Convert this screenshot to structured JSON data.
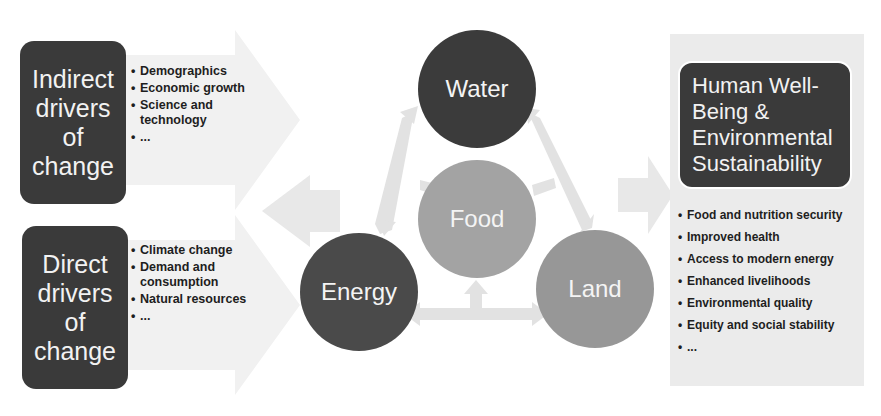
{
  "diagram": {
    "left": {
      "indirect": {
        "title_lines": [
          "Indirect",
          "drivers",
          "of",
          "change"
        ],
        "bullets": [
          "Demographics",
          "Economic growth",
          "Science and technology",
          "..."
        ]
      },
      "direct": {
        "title_lines": [
          "Direct",
          "drivers",
          "of",
          "change"
        ],
        "bullets": [
          "Climate change",
          "Demand and consumption",
          "Natural resources",
          "..."
        ]
      }
    },
    "nexus": {
      "water": "Water",
      "food": "Food",
      "energy": "Energy",
      "land": "Land"
    },
    "right": {
      "title_lines": [
        "Human Well-",
        "Being &",
        "Environmental",
        "Sustainability"
      ],
      "bullets": [
        "Food and nutrition security",
        "Improved health",
        "Access to modern energy",
        "Enhanced livelihoods",
        "Environmental quality",
        "Equity and social stability",
        "..."
      ]
    },
    "colors": {
      "dark": "#3a3a3a",
      "mid": "#9a9a9a",
      "arrow": "#e6e6e6",
      "panel": "#ebebeb"
    }
  }
}
